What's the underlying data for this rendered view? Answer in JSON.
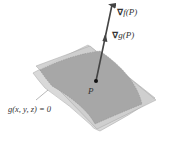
{
  "diagram": {
    "type": "gradient-vectors-on-surface",
    "labels": {
      "grad_f": {
        "nabla": "∇",
        "text": "f(P)"
      },
      "grad_g": {
        "nabla": "∇",
        "text": "g(P)"
      },
      "point": "P",
      "surface": "g(x, y, z) = 0"
    },
    "colors": {
      "tangent_plane": "#d4d4d4",
      "tangent_plane_edge": "#a8a8a8",
      "surface": "#a9a9a9",
      "surface_edge": "#8a8a8a",
      "arrow": "#444444",
      "text": "#333333",
      "background": "#ffffff"
    }
  }
}
